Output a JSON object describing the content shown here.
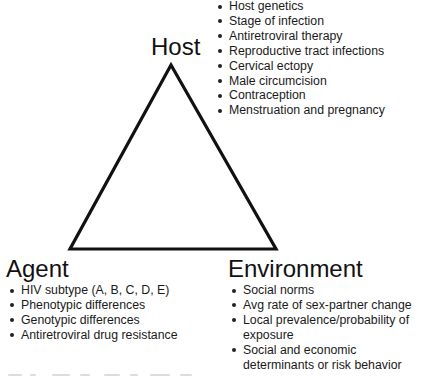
{
  "diagram": {
    "type": "epidemiological-triangle",
    "stroke_color": "#111111",
    "nodes": {
      "host": {
        "label": "Host",
        "factors": [
          "Host genetics",
          "Stage of infection",
          "Antiretroviral therapy",
          "Reproductive tract infections",
          "Cervical ectopy",
          "Male circumcision",
          "Contraception",
          "Menstruation and pregnancy"
        ]
      },
      "agent": {
        "label": "Agent",
        "factors": [
          "HIV subtype (A, B, C, D, E)",
          "Phenotypic differences",
          "Genotypic differences",
          "Antiretroviral drug resistance"
        ]
      },
      "environment": {
        "label": "Environment",
        "factors": [
          {
            "line1": "Social norms"
          },
          {
            "line1": "Avg rate of sex-partner change"
          },
          {
            "line1": "Local prevalence/probability of",
            "line2": "exposure"
          },
          {
            "line1": "Social and economic",
            "line2": "determinants or risk behavior"
          }
        ]
      }
    }
  }
}
